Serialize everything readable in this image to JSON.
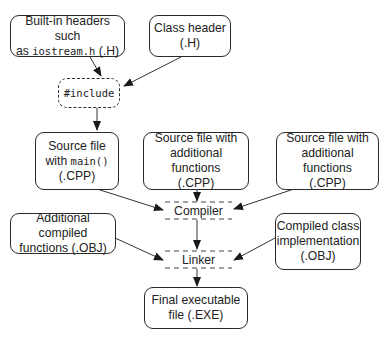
{
  "diagram": {
    "nodes": {
      "builtin_headers": {
        "line1": "Built-in headers such",
        "line2_prefix": "as ",
        "line2_code": "iostream.h",
        "line2_suffix": " (.H)"
      },
      "class_header": {
        "line1": "Class header",
        "line2": "(.H)"
      },
      "include": {
        "label": "#include"
      },
      "source_main": {
        "line1": "Source file",
        "line2_prefix": "with ",
        "line2_code": "main()",
        "line3": "(.CPP)"
      },
      "source_additional_1": {
        "line1": "Source file with",
        "line2": "additional functions",
        "line3": "(.CPP)"
      },
      "source_additional_2": {
        "line1": "Source file with",
        "line2": "additional functions",
        "line3": "(.CPP)"
      },
      "compiler": {
        "label": "Compiler"
      },
      "additional_compiled": {
        "line1": "Additional compiled",
        "line2": "functions (.OBJ)"
      },
      "compiled_class": {
        "line1": "Compiled class",
        "line2": "implementation",
        "line3": "(.OBJ)"
      },
      "linker": {
        "label": "Linker"
      },
      "final_exe": {
        "line1": "Final executable",
        "line2": "file (.EXE)"
      }
    },
    "edges": [
      [
        "builtin_headers",
        "include"
      ],
      [
        "class_header",
        "include"
      ],
      [
        "include",
        "source_main"
      ],
      [
        "source_main",
        "compiler"
      ],
      [
        "source_additional_1",
        "compiler"
      ],
      [
        "source_additional_2",
        "compiler"
      ],
      [
        "compiler",
        "linker"
      ],
      [
        "additional_compiled",
        "linker"
      ],
      [
        "compiled_class",
        "linker"
      ],
      [
        "linker",
        "final_exe"
      ]
    ],
    "colors": {
      "stroke": "#2a2a2a",
      "background": "#ffffff",
      "text": "#222222"
    }
  }
}
